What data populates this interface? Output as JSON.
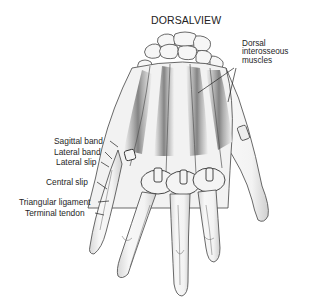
{
  "diagram": {
    "title": "DORSALVIEW",
    "callout_right": {
      "lines": [
        "Dorsal",
        "interosseous",
        "muscles"
      ]
    },
    "labels_left": [
      {
        "text": "Sagittal band"
      },
      {
        "text": "Lateral band"
      },
      {
        "text": "Lateral slip"
      },
      {
        "text": "Central slip"
      },
      {
        "text": "Triangular ligament"
      },
      {
        "text": "Terminal tendon"
      }
    ],
    "colors": {
      "background": "#ffffff",
      "line": "#3a3a3a",
      "shade": "#9a9a9a",
      "text": "#1e1e1e"
    }
  }
}
